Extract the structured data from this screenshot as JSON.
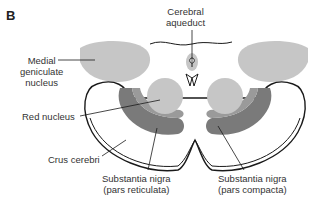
{
  "figure": {
    "panel_letter": "B"
  },
  "labels": {
    "cerebral_aqueduct": [
      "Cerebral",
      "aqueduct"
    ],
    "medial_geniculate": [
      "Medial",
      "geniculate",
      "nucleus"
    ],
    "red_nucleus": "Red nucleus",
    "crus_cerebri": "Crus cerebri",
    "substantia_nigra_reticulata": [
      "Substantia nigra",
      "(pars reticulata)"
    ],
    "substantia_nigra_compacta": [
      "Substantia nigra",
      "(pars compacta)"
    ]
  },
  "colors": {
    "light_gray": "#c6c6c6",
    "mid_gray": "#9a9a9a",
    "dark_gray": "#7a7a7a",
    "outline": "#1a1a1a",
    "band": "#d9d9d9"
  }
}
